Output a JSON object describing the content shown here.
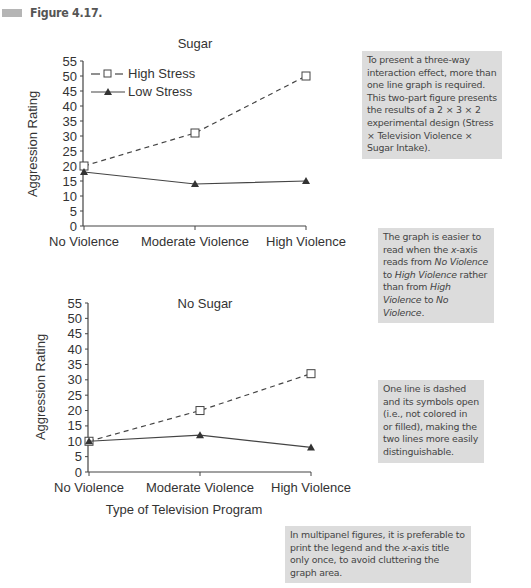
{
  "figure": {
    "label": "Figure 4.17."
  },
  "legend": {
    "high_stress": "High Stress",
    "low_stress": "Low Stress"
  },
  "axes": {
    "ylabel": "Aggression Rating",
    "xlabel": "Type of Television Program",
    "yticks": [
      "0",
      "5",
      "10",
      "15",
      "20",
      "25",
      "30",
      "35",
      "40",
      "45",
      "50",
      "55"
    ],
    "xticks": [
      "No Violence",
      "Moderate Violence",
      "High Violence"
    ]
  },
  "panels": {
    "top": {
      "title": "Sugar"
    },
    "bottom": {
      "title": "No Sugar"
    }
  },
  "notes": {
    "note1": "To present a three-way interaction effect, more than one line graph is required. This two-part figure presents the results of a 2 × 3 × 2 experimental design (Stress × Television Violence × Sugar Intake).",
    "note2_a": "The graph is easier to read when the ",
    "note2_b": "x",
    "note2_c": "-axis reads from ",
    "note2_d": "No Violence",
    "note2_e": " to ",
    "note2_f": "High Violence",
    "note2_g": " rather than from ",
    "note2_h": "High Violence",
    "note2_i": " to ",
    "note2_j": "No Violence",
    "note2_k": ".",
    "note3": "One line is dashed and its symbols open (i.e., not colored in or filled), making the two lines more easily distinguishable.",
    "note4_a": "In multipanel figures, it is preferable to print the legend and the ",
    "note4_b": "x",
    "note4_c": "-axis title only once, to avoid cluttering the graph area."
  },
  "chart_data": [
    {
      "type": "line",
      "title": "Sugar",
      "categories": [
        "No Violence",
        "Moderate Violence",
        "High Violence"
      ],
      "series": [
        {
          "name": "High Stress",
          "style": "dashed, open square markers",
          "values": [
            20,
            31,
            50
          ]
        },
        {
          "name": "Low Stress",
          "style": "solid, filled triangle markers",
          "values": [
            18,
            14,
            15
          ]
        }
      ],
      "xlabel": "",
      "ylabel": "Aggression Rating",
      "ylim": [
        0,
        55
      ],
      "yticks_step": 5,
      "grid": false,
      "legend_position": "upper left inside plot"
    },
    {
      "type": "line",
      "title": "No Sugar",
      "categories": [
        "No Violence",
        "Moderate Violence",
        "High Violence"
      ],
      "series": [
        {
          "name": "High Stress",
          "style": "dashed, open square markers",
          "values": [
            10,
            20,
            32
          ]
        },
        {
          "name": "Low Stress",
          "style": "solid, filled triangle markers",
          "values": [
            10,
            12,
            8
          ]
        }
      ],
      "xlabel": "Type of Television Program",
      "ylabel": "Aggression Rating",
      "ylim": [
        0,
        55
      ],
      "yticks_step": 5,
      "grid": false
    }
  ]
}
